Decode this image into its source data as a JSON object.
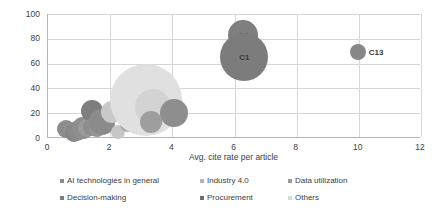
{
  "chart_data": {
    "type": "scatter",
    "title": "",
    "xlabel": "Avg. cite rate per article",
    "ylabel": "Avg. cites per article",
    "xlim": [
      0,
      12
    ],
    "ylim": [
      0,
      100
    ],
    "xticks": [
      "0",
      "2",
      "4",
      "6",
      "8",
      "10",
      "12"
    ],
    "yticks": [
      "0",
      "20",
      "40",
      "60",
      "80",
      "100"
    ],
    "grid": "both",
    "legend_position": "bottom",
    "legend": [
      {
        "label": "AI technologies in general",
        "color": "#8a8a8a"
      },
      {
        "label": "Industry 4.0",
        "color": "#b4b4b4"
      },
      {
        "label": "Data utilization",
        "color": "#9a9a9a"
      },
      {
        "label": "Decision-making",
        "color": "#7d7d7d"
      },
      {
        "label": "Procurement",
        "color": "#6e6e6e"
      },
      {
        "label": "Others",
        "color": "#d8d8d8"
      }
    ],
    "points": [
      {
        "label": "",
        "series": "AI technologies in general",
        "x": 0.62,
        "y": 7,
        "size": 9,
        "color": "#8c8c8c"
      },
      {
        "label": "",
        "series": "AI technologies in general",
        "x": 0.78,
        "y": 6,
        "size": 8,
        "color": "#8f8f8f"
      },
      {
        "label": "",
        "series": "Decision-making",
        "x": 0.86,
        "y": 4,
        "size": 9,
        "color": "#848484"
      },
      {
        "label": "",
        "series": "Decision-making",
        "x": 0.98,
        "y": 6,
        "size": 10,
        "color": "#8a8a8a"
      },
      {
        "label": "",
        "series": "Data utilization",
        "x": 1.16,
        "y": 8,
        "size": 11,
        "color": "#8f8f8f"
      },
      {
        "label": "",
        "series": "AI technologies in general",
        "x": 1.3,
        "y": 8,
        "size": 9,
        "color": "#9a9a9a"
      },
      {
        "label": "",
        "series": "Procurement",
        "x": 1.44,
        "y": 22,
        "size": 11,
        "color": "#7e7e7e"
      },
      {
        "label": "",
        "series": "Decision-making",
        "x": 1.46,
        "y": 9,
        "size": 9,
        "color": "#8d8d8d"
      },
      {
        "label": "",
        "series": "Data utilization",
        "x": 1.62,
        "y": 7,
        "size": 8,
        "color": "#949494"
      },
      {
        "label": "",
        "series": "Industry 4.0",
        "x": 1.78,
        "y": 13,
        "size": 13,
        "color": "#8b8b8b"
      },
      {
        "label": "",
        "series": "Others",
        "x": 2.08,
        "y": 21,
        "size": 11,
        "color": "#c9c9c9"
      },
      {
        "label": "",
        "series": "Others",
        "x": 2.28,
        "y": 5,
        "size": 7,
        "color": "#c6c6c6"
      },
      {
        "label": "",
        "series": "Data utilization",
        "x": 2.6,
        "y": 11,
        "size": 8,
        "color": "#a5a5a5"
      },
      {
        "label": "",
        "series": "Others",
        "x": 3.18,
        "y": 31,
        "size": 36,
        "color": "#e0e0e0"
      },
      {
        "label": "",
        "series": "Others",
        "x": 3.42,
        "y": 25,
        "size": 18,
        "color": "#d3d3d3"
      },
      {
        "label": "",
        "series": "Industry 4.0",
        "x": 3.34,
        "y": 13,
        "size": 11,
        "color": "#9e9e9e"
      },
      {
        "label": "",
        "series": "AI technologies in general",
        "x": 4.1,
        "y": 20,
        "size": 14,
        "color": "#8e8e8e"
      },
      {
        "label": "C4",
        "series": "Others",
        "x": 6.32,
        "y": 83,
        "size": 15,
        "color": "#7f7f7f",
        "label_pos": "inside"
      },
      {
        "label": "C1",
        "series": "Others",
        "x": 6.35,
        "y": 65,
        "size": 24,
        "color": "#7c7c7c",
        "label_pos": "inside"
      },
      {
        "label": "C13",
        "series": "Others",
        "x": 10.0,
        "y": 69,
        "size": 8,
        "color": "#878787",
        "label_pos": "right"
      }
    ]
  }
}
